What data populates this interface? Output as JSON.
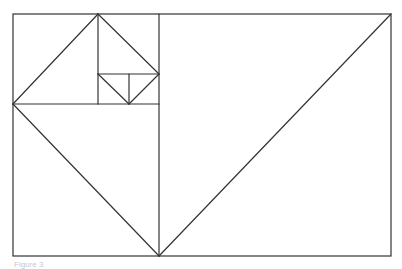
{
  "diagram": {
    "stroke_color": "#333333",
    "stroke_width": 1.2,
    "outer_rect": {
      "x1": 13,
      "y1": 14,
      "x2": 391,
      "y2": 256
    },
    "lines": [
      {
        "name": "divider-main-vertical",
        "x1": 159,
        "y1": 14,
        "x2": 159,
        "y2": 256
      },
      {
        "name": "divider-square-horizontal",
        "x1": 13,
        "y1": 104,
        "x2": 159,
        "y2": 104
      },
      {
        "name": "divider-second-vertical",
        "x1": 98,
        "y1": 14,
        "x2": 98,
        "y2": 104
      },
      {
        "name": "divider-third-horizontal",
        "x1": 98,
        "y1": 74,
        "x2": 159,
        "y2": 74
      },
      {
        "name": "divider-fourth-vertical",
        "x1": 129,
        "y1": 74,
        "x2": 129,
        "y2": 104
      },
      {
        "name": "diagonal-large-right",
        "x1": 159,
        "y1": 256,
        "x2": 391,
        "y2": 14
      },
      {
        "name": "diagonal-square-lower",
        "x1": 13,
        "y1": 104,
        "x2": 159,
        "y2": 256
      },
      {
        "name": "diagonal-upper-left",
        "x1": 13,
        "y1": 104,
        "x2": 98,
        "y2": 14
      },
      {
        "name": "diagonal-upper-right",
        "x1": 98,
        "y1": 14,
        "x2": 159,
        "y2": 74
      },
      {
        "name": "diagonal-small-left",
        "x1": 98,
        "y1": 74,
        "x2": 129,
        "y2": 104
      },
      {
        "name": "diagonal-small-right",
        "x1": 129,
        "y1": 104,
        "x2": 159,
        "y2": 74
      }
    ]
  },
  "caption": "Figure 3"
}
